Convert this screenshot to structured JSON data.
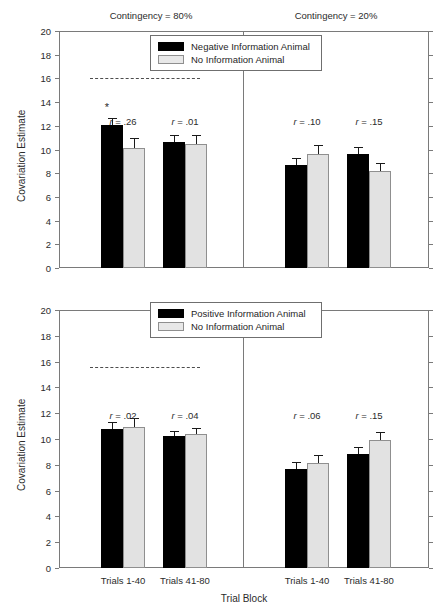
{
  "chart_data": {
    "type": "bar",
    "title": "",
    "xlabel": "Trial Block",
    "ylabel": "Covariation Estimate",
    "ylim": [
      0,
      20
    ],
    "yticks": [
      0,
      2,
      4,
      6,
      8,
      10,
      12,
      14,
      16,
      18,
      20
    ],
    "grid": false,
    "legend_position": "top-center inside each panel",
    "categories": [
      "Trials 1-40",
      "Trials 41-80"
    ],
    "panel_headers": [
      "Contingency = 80%",
      "Contingency = 20%"
    ],
    "panels": [
      {
        "name": "upper",
        "legend": [
          {
            "label": "Negative Information Animal",
            "color": "#000000"
          },
          {
            "label": "No Information Animal",
            "color": "#e8e8e8"
          }
        ],
        "groups": [
          {
            "contingency": "Contingency = 80%",
            "reference_line": 16,
            "reference_line_color": "#4d4d4d",
            "blocks": [
              {
                "category": "Trials 1-40",
                "annotation": "r = .26",
                "significant": true,
                "bars": [
                  {
                    "series": "Negative Information Animal",
                    "value": 12.1,
                    "error": 0.55
                  },
                  {
                    "series": "No Information Animal",
                    "value": 10.1,
                    "error": 0.85
                  }
                ]
              },
              {
                "category": "Trials 41-80",
                "annotation": "r = .01",
                "significant": false,
                "bars": [
                  {
                    "series": "Negative Information Animal",
                    "value": 10.6,
                    "error": 0.65
                  },
                  {
                    "series": "No Information Animal",
                    "value": 10.45,
                    "error": 0.8
                  }
                ]
              }
            ]
          },
          {
            "contingency": "Contingency = 20%",
            "reference_line": 4,
            "reference_line_color": "#ffffff",
            "blocks": [
              {
                "category": "Trials 1-40",
                "annotation": "r = .10",
                "significant": false,
                "bars": [
                  {
                    "series": "Negative Information Animal",
                    "value": 8.7,
                    "error": 0.6
                  },
                  {
                    "series": "No Information Animal",
                    "value": 9.6,
                    "error": 0.75
                  }
                ]
              },
              {
                "category": "Trials 41-80",
                "annotation": "r = .15",
                "significant": false,
                "bars": [
                  {
                    "series": "Negative Information Animal",
                    "value": 9.6,
                    "error": 0.65
                  },
                  {
                    "series": "No Information Animal",
                    "value": 8.15,
                    "error": 0.75
                  }
                ]
              }
            ]
          }
        ]
      },
      {
        "name": "lower",
        "legend": [
          {
            "label": "Positive Information Animal",
            "color": "#000000"
          },
          {
            "label": "No Information Animal",
            "color": "#e8e8e8"
          }
        ],
        "groups": [
          {
            "contingency": "Contingency = 80%",
            "reference_line": 15.6,
            "reference_line_color": "#4d4d4d",
            "blocks": [
              {
                "category": "Trials 1-40",
                "annotation": "r = .02",
                "significant": false,
                "bars": [
                  {
                    "series": "Positive Information Animal",
                    "value": 10.75,
                    "error": 0.6
                  },
                  {
                    "series": "No Information Animal",
                    "value": 10.95,
                    "error": 0.65
                  }
                ]
              },
              {
                "category": "Trials 41-80",
                "annotation": "r = .04",
                "significant": false,
                "bars": [
                  {
                    "series": "Positive Information Animal",
                    "value": 10.2,
                    "error": 0.45
                  },
                  {
                    "series": "No Information Animal",
                    "value": 10.4,
                    "error": 0.45
                  }
                ]
              }
            ]
          },
          {
            "contingency": "Contingency = 20%",
            "reference_line": 4,
            "reference_line_color": "#ffffff",
            "blocks": [
              {
                "category": "Trials 1-40",
                "annotation": "r = .06",
                "significant": false,
                "bars": [
                  {
                    "series": "Positive Information Animal",
                    "value": 7.65,
                    "error": 0.55
                  },
                  {
                    "series": "No Information Animal",
                    "value": 8.15,
                    "error": 0.6
                  }
                ]
              },
              {
                "category": "Trials 41-80",
                "annotation": "r = .15",
                "significant": false,
                "bars": [
                  {
                    "series": "Positive Information Animal",
                    "value": 8.8,
                    "error": 0.6
                  },
                  {
                    "series": "No Information Animal",
                    "value": 9.95,
                    "error": 0.6
                  }
                ]
              }
            ]
          }
        ]
      }
    ]
  },
  "significance_marker": "*"
}
